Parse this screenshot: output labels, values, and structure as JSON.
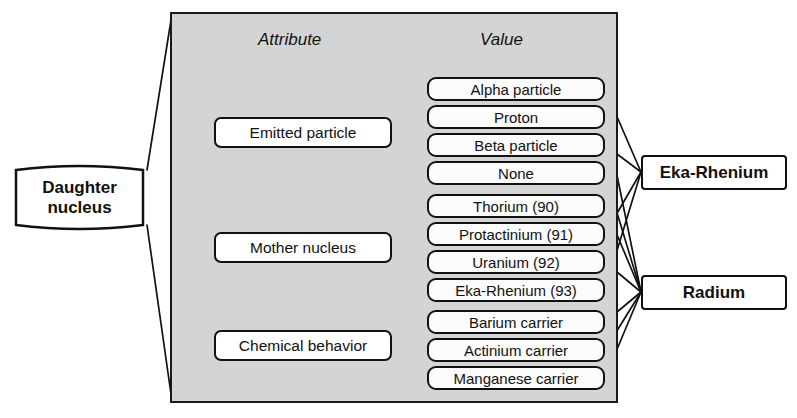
{
  "diagram": {
    "columns": {
      "attribute_header": "Attribute",
      "value_header": "Value"
    },
    "source_node": {
      "line1": "Daughter",
      "line2": "nucleus"
    },
    "attributes": [
      {
        "id": "emitted-particle",
        "label": "Emitted particle"
      },
      {
        "id": "mother-nucleus",
        "label": "Mother nucleus"
      },
      {
        "id": "chemical-behavior",
        "label": "Chemical behavior"
      }
    ],
    "values": [
      {
        "id": "alpha-particle",
        "label": "Alpha particle",
        "group": "emitted-particle"
      },
      {
        "id": "proton",
        "label": "Proton",
        "group": "emitted-particle"
      },
      {
        "id": "beta-particle",
        "label": "Beta particle",
        "group": "emitted-particle"
      },
      {
        "id": "none",
        "label": "None",
        "group": "emitted-particle"
      },
      {
        "id": "thorium-90",
        "label": "Thorium (90)",
        "group": "mother-nucleus"
      },
      {
        "id": "protactinium-91",
        "label": "Protactinium (91)",
        "group": "mother-nucleus"
      },
      {
        "id": "uranium-92",
        "label": "Uranium (92)",
        "group": "mother-nucleus"
      },
      {
        "id": "eka-rhenium-93",
        "label": "Eka-Rhenium (93)",
        "group": "mother-nucleus"
      },
      {
        "id": "barium-carrier",
        "label": "Barium carrier",
        "group": "chemical-behavior"
      },
      {
        "id": "actinium-carrier",
        "label": "Actinium carrier",
        "group": "chemical-behavior"
      },
      {
        "id": "manganese-carrier",
        "label": "Manganese carrier",
        "group": "chemical-behavior"
      }
    ],
    "results": [
      {
        "id": "eka-rhenium",
        "label": "Eka-Rhenium"
      },
      {
        "id": "radium",
        "label": "Radium"
      }
    ],
    "colors": {
      "panel_fill": "#d4d4d4",
      "box_fill": "#ffffff",
      "line": "#111111",
      "background": "#ffffff"
    }
  }
}
